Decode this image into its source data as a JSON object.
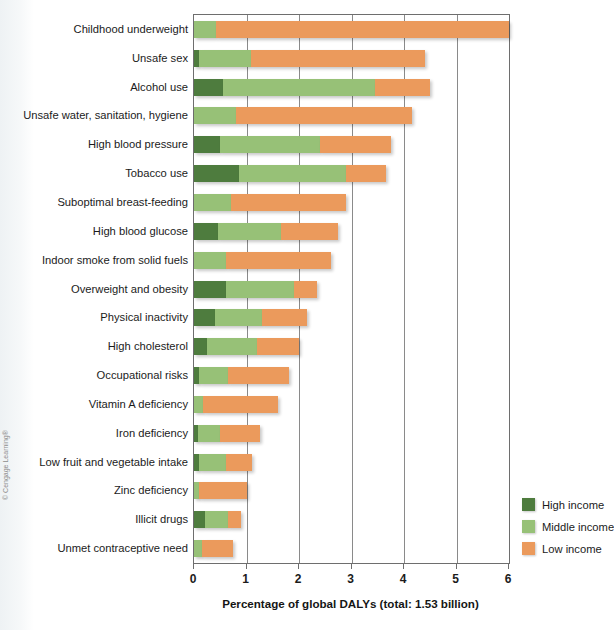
{
  "credit": "© Cengage Learning®",
  "axis": {
    "x_title": "Percentage of global DALYs (total: 1.53 billion)",
    "x_ticks": [
      "0",
      "1",
      "2",
      "3",
      "4",
      "5",
      "6"
    ]
  },
  "legend": {
    "items": [
      {
        "label": "High income",
        "color": "#4e7c3e",
        "key": "high"
      },
      {
        "label": "Middle income",
        "color": "#97c177",
        "key": "middle"
      },
      {
        "label": "Low income",
        "color": "#eb9a5c",
        "key": "low"
      }
    ]
  },
  "chart_data": {
    "type": "bar",
    "orientation": "horizontal",
    "stacked": true,
    "title": "",
    "xlabel": "Percentage of global DALYs (total: 1.53 billion)",
    "ylabel": "",
    "xlim": [
      0,
      6
    ],
    "xticks": [
      0,
      1,
      2,
      3,
      4,
      5,
      6
    ],
    "grid": "vertical",
    "legend_position": "bottom-right",
    "series": [
      {
        "name": "High income",
        "color": "#4e7c3e",
        "values": [
          0.0,
          0.1,
          0.55,
          0.0,
          0.5,
          0.85,
          0.0,
          0.45,
          0.0,
          0.6,
          0.4,
          0.25,
          0.1,
          0.0,
          0.07,
          0.1,
          0.0,
          0.2,
          0.0
        ]
      },
      {
        "name": "Middle income",
        "color": "#97c177",
        "values": [
          0.42,
          0.98,
          2.9,
          0.8,
          1.9,
          2.05,
          0.7,
          1.2,
          0.6,
          1.3,
          0.9,
          0.95,
          0.55,
          0.18,
          0.43,
          0.5,
          0.1,
          0.45,
          0.15
        ]
      },
      {
        "name": "Low income",
        "color": "#eb9a5c",
        "values": [
          5.58,
          3.32,
          1.05,
          3.35,
          1.35,
          0.75,
          2.2,
          1.1,
          2.0,
          0.45,
          0.85,
          0.8,
          1.15,
          1.42,
          0.75,
          0.5,
          0.9,
          0.25,
          0.6
        ]
      }
    ],
    "categories": [
      "Childhood underweight",
      "Unsafe sex",
      "Alcohol use",
      "Unsafe water, sanitation, hygiene",
      "High blood pressure",
      "Tobacco use",
      "Suboptimal breast-feeding",
      "High blood glucose",
      "Indoor smoke from solid fuels",
      "Overweight and obesity",
      "Physical inactivity",
      "High cholesterol",
      "Occupational risks",
      "Vitamin A deficiency",
      "Iron deficiency",
      "Low fruit and vegetable intake",
      "Zinc deficiency",
      "Illicit drugs",
      "Unmet contraceptive need"
    ],
    "totals": [
      6.0,
      4.4,
      4.5,
      4.15,
      3.75,
      3.65,
      2.9,
      2.75,
      2.6,
      2.35,
      2.15,
      2.0,
      1.8,
      1.6,
      1.25,
      1.1,
      1.0,
      0.9,
      0.75
    ]
  }
}
